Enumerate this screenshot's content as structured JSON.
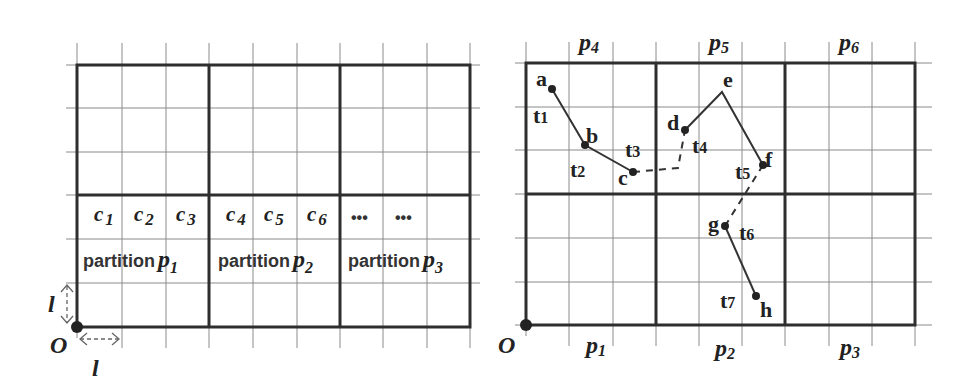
{
  "left_panel": {
    "cells": [
      {
        "base": "c",
        "sub": "1"
      },
      {
        "base": "c",
        "sub": "2"
      },
      {
        "base": "c",
        "sub": "3"
      },
      {
        "base": "c",
        "sub": "4"
      },
      {
        "base": "c",
        "sub": "5"
      },
      {
        "base": "c",
        "sub": "6"
      }
    ],
    "ellipsis": [
      "•••",
      "•••"
    ],
    "partitions": [
      {
        "word": "partition",
        "base": "p",
        "sub": "1"
      },
      {
        "word": "partition",
        "base": "p",
        "sub": "2"
      },
      {
        "word": "partition",
        "base": "p",
        "sub": "3"
      }
    ],
    "origin_label": "O",
    "cell_size_label_v": "l",
    "cell_size_label_h": "l"
  },
  "right_panel": {
    "origin_label": "O",
    "top_partitions": [
      {
        "base": "p",
        "sub": "4"
      },
      {
        "base": "p",
        "sub": "5"
      },
      {
        "base": "p",
        "sub": "6"
      }
    ],
    "bottom_partitions": [
      {
        "base": "p",
        "sub": "1"
      },
      {
        "base": "p",
        "sub": "2"
      },
      {
        "base": "p",
        "sub": "3"
      }
    ],
    "points": {
      "a": "a",
      "b": "b",
      "c": "c",
      "d": "d",
      "e": "e",
      "f": "f",
      "g": "g",
      "h": "h"
    },
    "times": [
      {
        "base": "t",
        "sub": "1"
      },
      {
        "base": "t",
        "sub": "2"
      },
      {
        "base": "t",
        "sub": "3"
      },
      {
        "base": "t",
        "sub": "4"
      },
      {
        "base": "t",
        "sub": "5"
      },
      {
        "base": "t",
        "sub": "6"
      },
      {
        "base": "t",
        "sub": "7"
      }
    ]
  }
}
